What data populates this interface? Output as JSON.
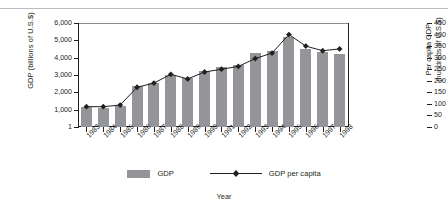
{
  "chart_data": {
    "type": "bar",
    "title": "",
    "xlabel": "Year",
    "ylabel": "GDP (billions of U.S.$)",
    "ylabel_right": "Per capita GDP\n(hundreds of U.S.$)",
    "categories": [
      "1983",
      "1984",
      "1985",
      "1986",
      "1987",
      "1988",
      "1989",
      "1990",
      "1991",
      "1992",
      "1993",
      "1994",
      "1995",
      "1996",
      "1997",
      "1998"
    ],
    "ylim": [
      1,
      6000
    ],
    "ylim_right": [
      0,
      450
    ],
    "yticks": [
      "1",
      "1,000",
      "2,000",
      "3,000",
      "4,000",
      "5,000",
      "6,000"
    ],
    "ytick_values": [
      1,
      1000,
      2000,
      3000,
      4000,
      5000,
      6000
    ],
    "yticks_right": [
      "0",
      "50",
      "100",
      "150",
      "200",
      "250",
      "300",
      "350",
      "400",
      "450"
    ],
    "ytick_values_right": [
      0,
      50,
      100,
      150,
      200,
      250,
      300,
      350,
      400,
      450
    ],
    "grid": false,
    "legend_position": "bottom",
    "series": [
      {
        "name": "GDP",
        "type": "bar",
        "axis": "left",
        "color": "#949599",
        "values": [
          1150,
          1120,
          1200,
          2350,
          2550,
          3000,
          2850,
          3250,
          3450,
          3600,
          4250,
          4400,
          5200,
          4500,
          4300,
          4200
        ]
      },
      {
        "name": "GDP per capita",
        "type": "line",
        "axis": "right",
        "color": "#231f20",
        "marker": "diamond",
        "values": [
          88,
          88,
          95,
          172,
          190,
          228,
          208,
          238,
          250,
          262,
          296,
          320,
          400,
          350,
          330,
          338
        ]
      }
    ]
  },
  "legend": {
    "items": [
      {
        "label": "GDP",
        "marker": "bar-swatch"
      },
      {
        "label": "GDP per capita",
        "marker": "line-diamond"
      }
    ]
  },
  "colors": {
    "bar": "#949599",
    "line": "#231f20",
    "axis": "#231f20",
    "rule": "#b9bbbd",
    "background": "#ffffff"
  }
}
